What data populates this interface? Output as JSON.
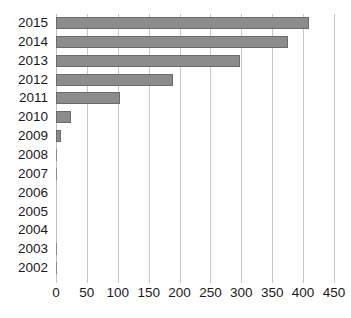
{
  "chart_data": {
    "type": "bar",
    "orientation": "horizontal",
    "title": "",
    "subtitle": "",
    "xlabel": "",
    "ylabel": "",
    "categories": [
      "2015",
      "2014",
      "2013",
      "2012",
      "2011",
      "2010",
      "2009",
      "2008",
      "2007",
      "2006",
      "2005",
      "2004",
      "2003",
      "2002"
    ],
    "values": [
      410,
      375,
      298,
      190,
      103,
      25,
      8,
      1,
      1,
      0,
      0,
      0,
      1,
      1
    ],
    "xlim": [
      0,
      450
    ],
    "xticks": [
      0,
      50,
      100,
      150,
      200,
      250,
      300,
      350,
      400,
      450
    ],
    "xticklabels": [
      "0",
      "50",
      "100",
      "150",
      "200",
      "250",
      "300",
      "350",
      "400",
      "450"
    ],
    "grid": "vertical",
    "legend": null,
    "legend_position": "none",
    "bar_color": "#8c8c8c",
    "bar_border_color": "#6b6b6b",
    "gridline_color": "#c9c9c9",
    "text_color": "#1a1a1a",
    "background_color": "#ffffff"
  }
}
